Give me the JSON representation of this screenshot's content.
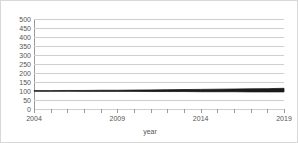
{
  "chart_data": {
    "type": "line",
    "title": "",
    "xlabel": "year",
    "ylabel": "",
    "xlim": [
      2004,
      2019
    ],
    "ylim": [
      0,
      500
    ],
    "grid": true,
    "legend": "none",
    "x_tick_labels": [
      "2004",
      "2009",
      "2014",
      "2019"
    ],
    "x_tick_values": [
      2004,
      2009,
      2014,
      2019
    ],
    "x_minor_ticks": [
      2004,
      2005,
      2006,
      2007,
      2008,
      2009,
      2010,
      2011,
      2012,
      2013,
      2014,
      2015,
      2016,
      2017,
      2018,
      2019
    ],
    "y_tick_labels": [
      "500",
      "450",
      "400",
      "350",
      "300",
      "250",
      "200",
      "150",
      "100",
      "50",
      "0"
    ],
    "y_tick_values": [
      500,
      450,
      400,
      350,
      300,
      250,
      200,
      150,
      100,
      50,
      0
    ],
    "line_color": "#1a1a1a",
    "grid_color": "#cfcfcf",
    "axis_color": "#9a9a9a",
    "x": [
      2004,
      2005,
      2006,
      2007,
      2008,
      2009,
      2010,
      2011,
      2012,
      2013,
      2014,
      2015,
      2016,
      2017,
      2018,
      2019
    ],
    "series": [
      {
        "name": "upper",
        "values": [
          102,
          102,
          103,
          103,
          104,
          104,
          105,
          106,
          107,
          108,
          109,
          110,
          111,
          112,
          113,
          115
        ]
      },
      {
        "name": "lower",
        "values": [
          99,
          99,
          99,
          98,
          98,
          98,
          98,
          97,
          97,
          97,
          96,
          96,
          96,
          95,
          95,
          95
        ]
      }
    ]
  }
}
